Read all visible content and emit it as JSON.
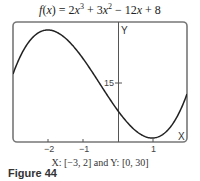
{
  "chart_data": {
    "type": "line",
    "title_parts": {
      "f": "f",
      "x": "x",
      "eq": " = 2",
      "t1": "3",
      "p2": " + 3",
      "t2": "2",
      "rest": " − 12x + 8"
    },
    "function": "2x^3 + 3x^2 - 12x + 8",
    "xlim": [
      -3,
      2
    ],
    "ylim": [
      0,
      30
    ],
    "xlabel": "X",
    "ylabel": "Y",
    "x_ticks": [
      -2,
      -1,
      1
    ],
    "x_tick_labels": [
      "−2",
      "−1",
      "1"
    ],
    "y_ticks": [
      15
    ],
    "y_tick_labels": [
      "15"
    ],
    "grid": false,
    "points": [
      {
        "x": -3,
        "y": -1
      },
      {
        "x": -2.5,
        "y": 14.5
      },
      {
        "x": -2,
        "y": 28
      },
      {
        "x": -1.5,
        "y": 23.5
      },
      {
        "x": -1,
        "y": 21
      },
      {
        "x": -0.5,
        "y": 14.5
      },
      {
        "x": 0,
        "y": 8
      },
      {
        "x": 0.5,
        "y": 2.5
      },
      {
        "x": 1,
        "y": 1
      },
      {
        "x": 1.5,
        "y": 5.5
      },
      {
        "x": 2,
        "y": 12
      }
    ],
    "window_caption": "X: [−3, 2] and Y: [0, 30]"
  },
  "caption": {
    "window": "X: [−3, 2] and Y: [0, 30]",
    "figure": "Figure 44"
  }
}
